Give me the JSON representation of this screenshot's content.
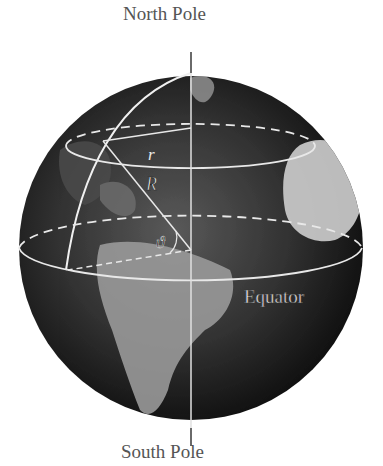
{
  "labels": {
    "north_pole": "North Pole",
    "south_pole": "South Pole",
    "equator": "Equator",
    "small_radius": "r",
    "big_radius": "R",
    "angle": "ϑ"
  },
  "colors": {
    "background": "#ffffff",
    "globe_dark": "#1a1a1a",
    "line": "#e8e8e8",
    "axis": "#6a6a6a"
  }
}
